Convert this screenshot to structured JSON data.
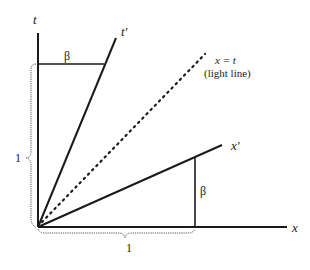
{
  "diagram": {
    "colors": {
      "axis": "#1a1a1a",
      "dotted": "#1a1a1a",
      "brace": "#555555",
      "text": "#222222"
    },
    "labels": {
      "t_axis": "t",
      "t_prime_axis": "t′",
      "x_axis": "x",
      "x_prime_axis": "x′",
      "light_line_eq": "x = t",
      "light_line_note": "(light line)",
      "beta_top": "β",
      "beta_right": "β",
      "unit_vertical": "1",
      "unit_horizontal": "1"
    },
    "geometry": {
      "origin": [
        38,
        227
      ],
      "t_axis_end": [
        38,
        33
      ],
      "t_prime_end": [
        116,
        38
      ],
      "light_line_end": [
        205,
        54
      ],
      "x_prime_end": [
        222,
        145
      ],
      "x_axis_end": [
        287,
        227
      ],
      "beta_top_segment": [
        [
          38,
          64
        ],
        [
          104,
          64
        ]
      ],
      "beta_right_segment": [
        [
          195,
          157
        ],
        [
          195,
          227
        ]
      ]
    }
  }
}
